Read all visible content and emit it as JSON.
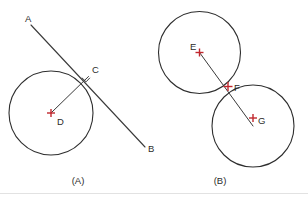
{
  "figure": {
    "background_color": "#ffffff",
    "stroke_color": "#2e2e2e",
    "marker_color": "#c1272d",
    "label_color": "#2b2b2b",
    "width": 308,
    "height": 200
  },
  "panels": [
    {
      "id": "panel-a",
      "caption": "(A)",
      "caption_x": 78,
      "caption_y": 184,
      "description": "A line tangent to a circle at a point, with the radius drawn to the point of tangency and a right-angle marker.",
      "circles": [
        {
          "name": "circle-d",
          "cx": 51,
          "cy": 113,
          "r": 42
        }
      ],
      "lines": [
        {
          "name": "tangent-line-ab",
          "x1": 31,
          "y1": 25,
          "x2": 145,
          "y2": 147
        },
        {
          "name": "radius-line-dc",
          "x1": 51,
          "y1": 113,
          "x2": 88.5,
          "y2": 76.5
        }
      ],
      "right_angle": {
        "name": "right-angle-marker-c",
        "points": "81.8,77.7 86.1,81.8 89.9,77.8"
      },
      "markers": [
        {
          "name": "marker-d",
          "cx": 51,
          "cy": 113,
          "size": 4
        }
      ],
      "points": [
        {
          "name": "point-a",
          "label": "A",
          "x": 25,
          "y": 22
        },
        {
          "name": "point-b",
          "label": "B",
          "x": 148,
          "y": 152
        },
        {
          "name": "point-c",
          "label": "C",
          "x": 92,
          "y": 73
        },
        {
          "name": "point-d",
          "label": "D",
          "x": 57,
          "y": 125
        }
      ]
    },
    {
      "id": "panel-b",
      "caption": "(B)",
      "caption_x": 220,
      "caption_y": 184,
      "description": "Two externally tangent circles touching at a single point, with the line of centers passing through the point of tangency.",
      "circles": [
        {
          "name": "circle-e",
          "cx": 199.5,
          "cy": 52.5,
          "r": 41
        },
        {
          "name": "circle-g",
          "cx": 253,
          "cy": 126,
          "r": 41
        }
      ],
      "lines": [
        {
          "name": "center-line-eg",
          "x1": 199.5,
          "y1": 52.5,
          "x2": 253,
          "y2": 126
        }
      ],
      "markers": [
        {
          "name": "marker-e",
          "cx": 199.5,
          "cy": 52.5,
          "size": 4
        },
        {
          "name": "marker-f",
          "cx": 228,
          "cy": 86.5,
          "size": 4.5
        },
        {
          "name": "marker-g",
          "cx": 253,
          "cy": 118,
          "size": 4
        }
      ],
      "points": [
        {
          "name": "point-e",
          "label": "E",
          "x": 190,
          "y": 50
        },
        {
          "name": "point-f",
          "label": "F",
          "x": 234,
          "y": 91
        },
        {
          "name": "point-g",
          "label": "G",
          "x": 258,
          "y": 124
        }
      ]
    }
  ],
  "footer_rule": {
    "name": "footer-divider",
    "x1": 0,
    "y1": 193.5,
    "x2": 308,
    "y2": 193.5
  }
}
